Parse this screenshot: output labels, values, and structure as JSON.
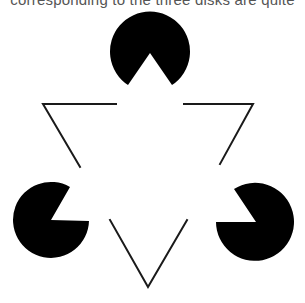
{
  "caption": {
    "text": "corresponding to the three disks are quite"
  },
  "figure": {
    "name": "Kanizsa triangle illusion",
    "colors": {
      "fill": "#000000",
      "stroke": "#1a1a1a",
      "background": "#ffffff"
    },
    "disks": [
      {
        "id": "top",
        "cx": 150,
        "cy": 52,
        "r": 40,
        "wedge_direction": "down"
      },
      {
        "id": "left",
        "cx": 51,
        "cy": 220,
        "r": 38,
        "wedge_direction": "upper-right"
      },
      {
        "id": "right",
        "cx": 256,
        "cy": 222,
        "r": 39,
        "wedge_direction": "upper-left"
      }
    ],
    "outline_triangle": {
      "orientation": "point-down",
      "line_width": 2
    }
  }
}
